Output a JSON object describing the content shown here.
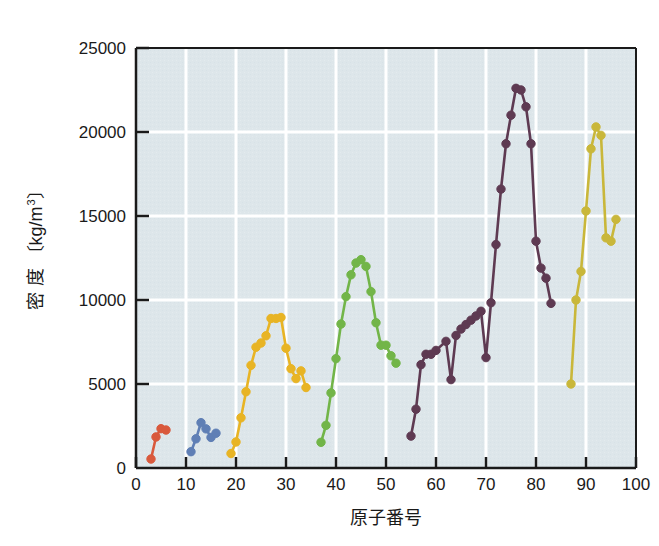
{
  "chart_data": {
    "type": "line",
    "title": "",
    "xlabel": "原子番号",
    "ylabel": "密 度 〔kg/m3〕",
    "ylabel_main": "密 度 〔kg/m",
    "ylabel_exponent": "3",
    "ylabel_close": "〕",
    "xlim": [
      0,
      100
    ],
    "ylim": [
      0,
      25000
    ],
    "xticks": [
      0,
      10,
      20,
      30,
      40,
      50,
      60,
      70,
      80,
      90,
      100
    ],
    "xtick_labels": [
      "0",
      "10",
      "20",
      "30",
      "40",
      "50",
      "60",
      "70",
      "80",
      "90",
      "100"
    ],
    "yticks": [
      0,
      5000,
      10000,
      15000,
      20000,
      25000
    ],
    "ytick_labels": [
      "0",
      "5000",
      "10000",
      "15000",
      "20000",
      "25000"
    ],
    "grid": true,
    "grid_color": "#ffffff",
    "plot_background": "#dde6ea",
    "legend": "none",
    "marker": "circle",
    "series": [
      {
        "name": "period-2",
        "color": "#d9593c",
        "x": [
          3,
          4,
          5,
          6
        ],
        "values": [
          534,
          1848,
          2340,
          2260
        ]
      },
      {
        "name": "period-3",
        "color": "#5f7fb5",
        "x": [
          11,
          12,
          13,
          14,
          15,
          16
        ],
        "values": [
          971,
          1738,
          2698,
          2330,
          1820,
          2070
        ]
      },
      {
        "name": "period-4",
        "color": "#e8b424",
        "x": [
          19,
          20,
          21,
          22,
          23,
          24,
          25,
          26,
          27,
          28,
          29,
          30,
          31,
          32,
          33,
          34
        ],
        "values": [
          862,
          1550,
          2990,
          4540,
          6110,
          7190,
          7440,
          7870,
          8900,
          8900,
          8960,
          7130,
          5910,
          5320,
          5780,
          4790
        ]
      },
      {
        "name": "period-5",
        "color": "#72b548",
        "x": [
          37,
          38,
          39,
          40,
          41,
          42,
          43,
          44,
          45,
          46,
          47,
          48,
          49,
          50,
          51,
          52
        ],
        "values": [
          1530,
          2540,
          4470,
          6510,
          8570,
          10200,
          11500,
          12200,
          12400,
          12000,
          10500,
          8650,
          7310,
          7310,
          6680,
          6240
        ]
      },
      {
        "name": "period-6",
        "color": "#5e3a52",
        "x": [
          55,
          56,
          57,
          58,
          59,
          60,
          62,
          63,
          64,
          65,
          66,
          67,
          68,
          69,
          70,
          71,
          72,
          73,
          74,
          75,
          76,
          77,
          78,
          79,
          80,
          81,
          82,
          83
        ],
        "values": [
          1900,
          3500,
          6150,
          6770,
          6770,
          7000,
          7540,
          5260,
          7890,
          8270,
          8540,
          8800,
          9050,
          9330,
          6570,
          9840,
          13300,
          16600,
          19300,
          21000,
          22600,
          22500,
          21500,
          19300,
          13500,
          11900,
          11300,
          9800
        ]
      },
      {
        "name": "period-7",
        "color": "#c9b73a",
        "x": [
          87,
          88,
          89,
          90,
          91,
          92,
          93,
          94,
          95,
          96
        ],
        "values": [
          5000,
          10000,
          11700,
          15300,
          19000,
          20300,
          19800,
          13700,
          13500,
          14800
        ]
      }
    ]
  }
}
